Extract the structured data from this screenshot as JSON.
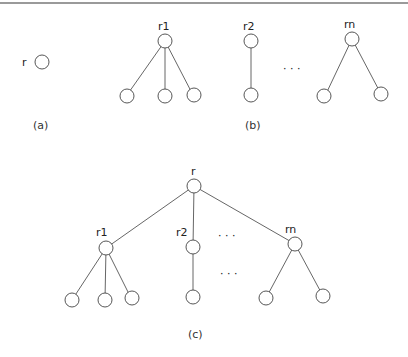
{
  "figure": {
    "panels": [
      {
        "id": "a",
        "caption": "(a)",
        "nodes": [
          {
            "label": "r"
          }
        ]
      },
      {
        "id": "b",
        "caption": "(b)",
        "roots": [
          "r1",
          "r2",
          "rn"
        ],
        "ellipsis": "· · ·"
      },
      {
        "id": "c",
        "caption": "(c)",
        "root": "r",
        "children": [
          "r1",
          "r2",
          "rn"
        ],
        "ellipsis": "· · ·"
      }
    ],
    "labels": {
      "a_r": "r",
      "b_r1": "r1",
      "b_r2": "r2",
      "b_rn": "rn",
      "b_dots": "· · ·",
      "b_caption": "(b)",
      "a_caption": "(a)",
      "c_r": "r",
      "c_r1": "r1",
      "c_r2": "r2",
      "c_rn": "rn",
      "c_dots1": "· · ·",
      "c_dots2": "· · ·",
      "c_caption": "(c)"
    }
  }
}
